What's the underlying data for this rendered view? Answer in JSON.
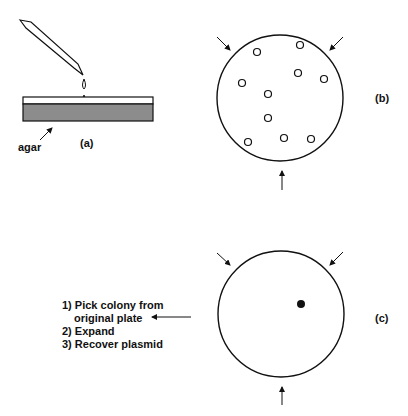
{
  "figure": {
    "panels": {
      "a": {
        "label": "(a)",
        "agar_label": "agar"
      },
      "b": {
        "label": "(b)",
        "colony_count": 10
      },
      "c": {
        "label": "(c)"
      }
    },
    "steps": [
      {
        "text": "1) Pick colony from"
      },
      {
        "text": "original plate"
      },
      {
        "text": "2) Expand"
      },
      {
        "text": "3) Recover plasmid"
      }
    ],
    "colors": {
      "line": "#111111",
      "agar_fill": "#8c8c8c",
      "background": "#ffffff"
    }
  }
}
